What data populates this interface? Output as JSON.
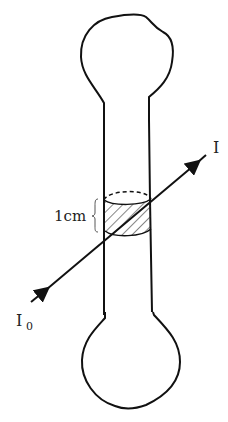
{
  "diagram": {
    "type": "absorption-tube",
    "labels": {
      "incident_intensity": "I",
      "incident_subscript": "0",
      "transmitted_intensity": "I",
      "path_length": "1cm"
    },
    "colors": {
      "stroke": "#111111",
      "background": "#ffffff",
      "label": "#222222"
    }
  }
}
